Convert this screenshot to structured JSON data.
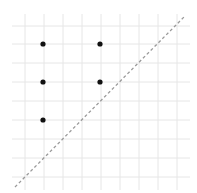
{
  "diagram": {
    "type": "dot-grid",
    "background": "#ffffff",
    "grid": {
      "color": "#e6e6e6",
      "vertical_x": [
        25,
        44,
        63,
        82,
        101,
        120,
        139,
        158,
        177
      ],
      "horizontal_y": [
        26,
        44,
        63,
        82,
        101,
        120,
        139,
        158,
        177
      ],
      "x_extent": [
        12,
        190
      ],
      "y_extent": [
        14,
        190
      ]
    },
    "points": [
      {
        "x": 43,
        "y": 44
      },
      {
        "x": 100,
        "y": 44
      },
      {
        "x": 43,
        "y": 82
      },
      {
        "x": 100,
        "y": 82
      },
      {
        "x": 43,
        "y": 120
      }
    ],
    "point_color": "#111111",
    "point_radius": 2.6,
    "diagonal": {
      "x1": 15,
      "y1": 187,
      "x2": 184,
      "y2": 17,
      "color": "#9a9a9a",
      "dash": "3 2.5",
      "width": 1.3
    }
  }
}
